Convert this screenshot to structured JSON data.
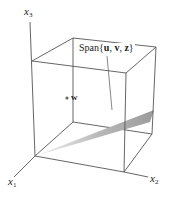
{
  "diagram": {
    "type": "3d-coordinate-box",
    "axes": [
      {
        "name": "x1",
        "label_main": "x",
        "label_sub": "1"
      },
      {
        "name": "x2",
        "label_main": "x",
        "label_sub": "2"
      },
      {
        "name": "x3",
        "label_main": "x",
        "label_sub": "3"
      }
    ],
    "span_label": {
      "prefix": "Span",
      "open": "{",
      "vectors": [
        "u",
        "v",
        "z"
      ],
      "text": "Span{u, v, z}"
    },
    "point": {
      "label": "w"
    },
    "colors": {
      "lines": "#555555",
      "plane_light": "#f2f2f2",
      "plane_dark": "#9a9a9a",
      "point": "#666666"
    }
  }
}
